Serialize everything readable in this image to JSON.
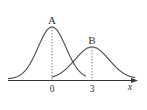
{
  "diagram": {
    "type": "normal-distribution-curves",
    "colors": {
      "curve": "#4a4a4a",
      "axis": "#333333",
      "dashed": "#666666",
      "text": "#333333"
    },
    "axis": {
      "label": "x"
    },
    "curves": [
      {
        "name": "A",
        "label": "A",
        "mean": 0,
        "mean_label": "0",
        "relative": "taller, narrower"
      },
      {
        "name": "B",
        "label": "B",
        "mean": 3,
        "mean_label": "3",
        "relative": "shorter, wider"
      }
    ]
  },
  "chart_data": {
    "type": "line",
    "title": "",
    "xlabel": "x",
    "ylabel": "",
    "series": [
      {
        "name": "A",
        "mean": 0,
        "peak_relative": 1.0
      },
      {
        "name": "B",
        "mean": 3,
        "peak_relative": 0.62
      }
    ],
    "x_ticks": [
      "0",
      "3"
    ]
  }
}
